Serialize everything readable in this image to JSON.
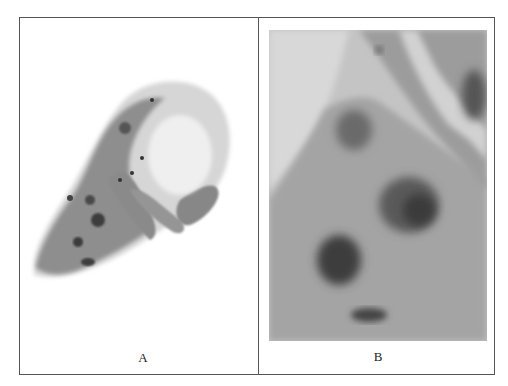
{
  "figure": {
    "panels": [
      {
        "id": "A",
        "label": "A",
        "description": "Low-magnification micrograph of a cluster of stained epithelial cells curled around a pale vacuole on a white background"
      },
      {
        "id": "B",
        "label": "B",
        "description": "High-magnification micrograph of stained cells with dark nuclei on a grey background"
      }
    ]
  },
  "colors": {
    "border": "#555555",
    "background": "#ffffff",
    "cell_light": "#a8a8a8",
    "cell_mid": "#8a8a8a",
    "nucleus": "#3c3c3c"
  }
}
